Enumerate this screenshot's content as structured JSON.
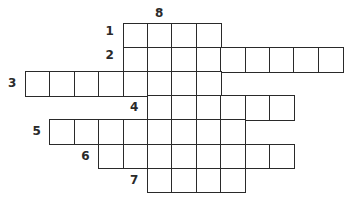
{
  "puzzle": {
    "type": "crossword",
    "across": [
      {
        "number": "1",
        "length": 4,
        "startCol": 4,
        "row": 0
      },
      {
        "number": "2",
        "length": 9,
        "startCol": 4,
        "row": 1
      },
      {
        "number": "3",
        "length": 8,
        "startCol": 0,
        "row": 2
      },
      {
        "number": "4",
        "length": 6,
        "startCol": 5,
        "row": 3
      },
      {
        "number": "5",
        "length": 8,
        "startCol": 1,
        "row": 4
      },
      {
        "number": "6",
        "length": 8,
        "startCol": 3,
        "row": 5
      },
      {
        "number": "7",
        "length": 4,
        "startCol": 5,
        "row": 6
      }
    ],
    "down": [
      {
        "number": "8",
        "length": 7,
        "startCol": 5,
        "row": 0
      }
    ]
  }
}
